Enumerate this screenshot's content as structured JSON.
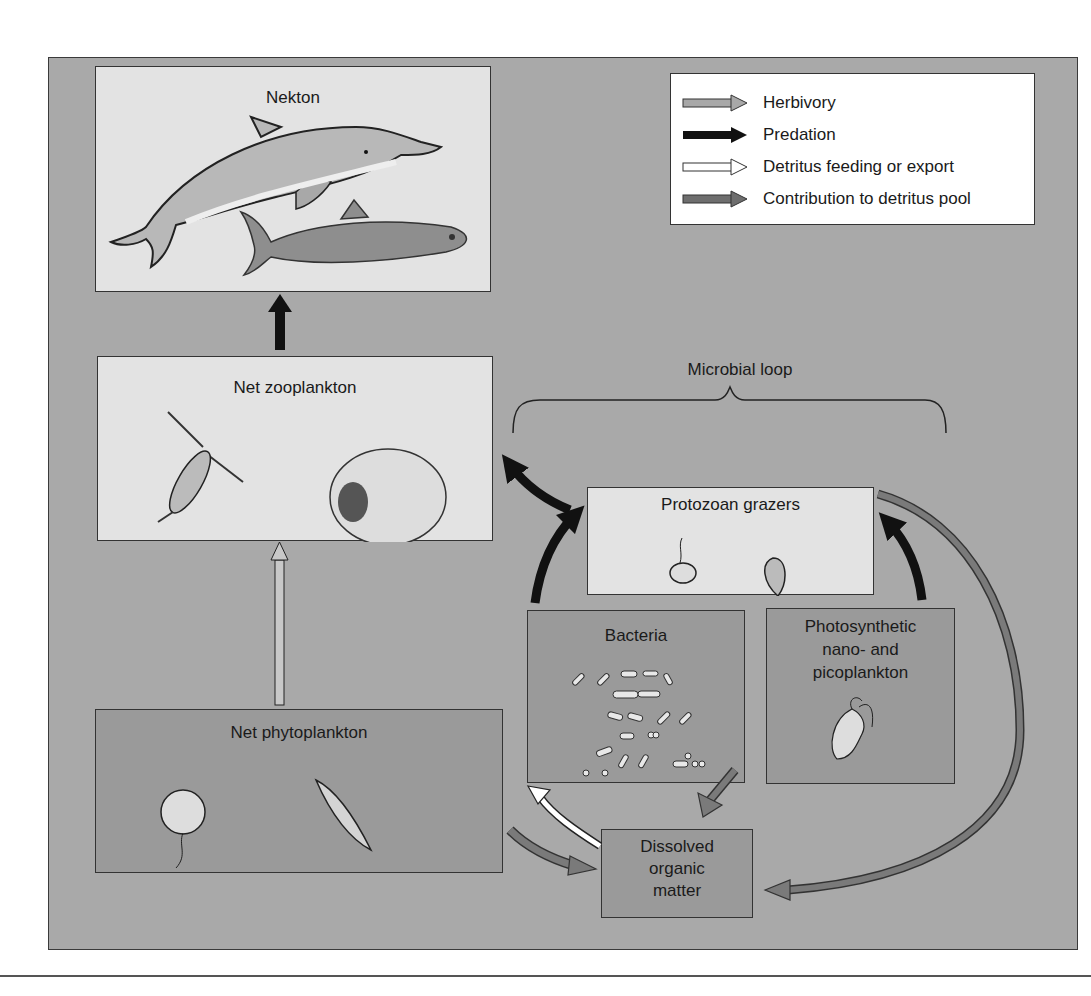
{
  "diagram": {
    "type": "marine food web with microbial loop",
    "nodes": {
      "nekton": {
        "label": "Nekton",
        "organisms": [
          "dolphin",
          "fish"
        ]
      },
      "net_zooplankton": {
        "label": "Net zooplankton",
        "organisms": [
          "copepod",
          "ciliate"
        ]
      },
      "protozoan_grazers": {
        "label": "Protozoan grazers",
        "organisms": [
          "flagellate",
          "ciliate"
        ]
      },
      "bacteria": {
        "label": "Bacteria"
      },
      "photosynthetic": {
        "label_lines": [
          "Photosynthetic",
          "nano- and",
          "picoplankton"
        ]
      },
      "net_phytoplankton": {
        "label": "Net phytoplankton",
        "organisms": [
          "dinoflagellate",
          "diatom"
        ]
      },
      "dom": {
        "label_lines": [
          "Dissolved",
          "organic",
          "matter"
        ]
      }
    },
    "group": {
      "label": "Microbial loop"
    },
    "legend": [
      {
        "label": "Herbivory",
        "color": "#a8a8a8",
        "icon": "arrow-herbivory-icon"
      },
      {
        "label": "Predation",
        "color": "#111111",
        "icon": "arrow-predation-icon"
      },
      {
        "label": "Detritus feeding or export",
        "color": "#ffffff",
        "icon": "arrow-detritus-icon"
      },
      {
        "label": "Contribution to detritus pool",
        "color": "#6e6e6e",
        "icon": "arrow-contribution-icon"
      }
    ],
    "edges": [
      {
        "from": "Net zooplankton",
        "to": "Nekton",
        "type": "Predation"
      },
      {
        "from": "Net phytoplankton",
        "to": "Net zooplankton",
        "type": "Herbivory"
      },
      {
        "from": "Protozoan grazers",
        "to": "Net zooplankton",
        "type": "Predation"
      },
      {
        "from": "Bacteria",
        "to": "Protozoan grazers",
        "type": "Predation"
      },
      {
        "from": "Photosynthetic nano- and picoplankton",
        "to": "Protozoan grazers",
        "type": "Predation"
      },
      {
        "from": "Dissolved organic matter",
        "to": "Bacteria",
        "type": "Detritus feeding or export"
      },
      {
        "from": "Net phytoplankton",
        "to": "Dissolved organic matter",
        "type": "Contribution to detritus pool"
      },
      {
        "from": "Photosynthetic nano- and picoplankton",
        "to": "Dissolved organic matter",
        "type": "Contribution to detritus pool"
      },
      {
        "from": "Protozoan grazers",
        "to": "Dissolved organic matter",
        "type": "Contribution to detritus pool"
      }
    ]
  }
}
